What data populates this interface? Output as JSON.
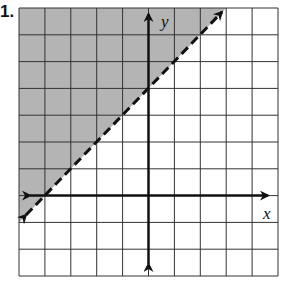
{
  "problem": {
    "number": "1."
  },
  "graph": {
    "x_axis_label": "x",
    "y_axis_label": "y",
    "x_range": [
      -5,
      5
    ],
    "y_range": [
      -3,
      7
    ],
    "grid_step": 1,
    "boundary_line": {
      "equation": "y = x + 4",
      "style": "dashed",
      "points": [
        [
          -5,
          -1
        ],
        [
          3,
          7
        ]
      ]
    },
    "shaded_region": "y > x + 4",
    "colors": {
      "shade": "#b4b4b4",
      "grid": "#333333",
      "axis": "#111111",
      "background": "#ffffff"
    }
  }
}
